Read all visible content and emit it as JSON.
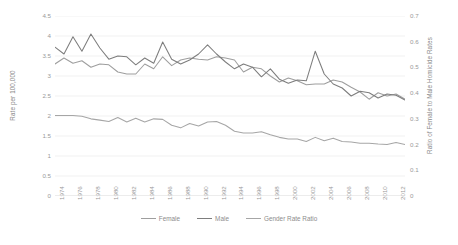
{
  "chart_data": {
    "type": "line",
    "title": "",
    "xlabel": "",
    "ylabel": "Rate per 100,000",
    "y2label": "Ratio of Female to Male Homicide Rates",
    "grid": true,
    "legend_position": "bottom",
    "ylim": [
      0,
      4.5
    ],
    "y2lim": [
      0,
      0.7
    ],
    "yticks": [
      "0",
      "0.5",
      "1",
      "1.5",
      "2",
      "2.5",
      "3",
      "3.5",
      "4",
      "4.5"
    ],
    "y2ticks": [
      "0",
      "0.1",
      "0.2",
      "0.3",
      "0.4",
      "0.5",
      "0.6",
      "0.7"
    ],
    "x": [
      1974,
      1975,
      1976,
      1977,
      1978,
      1979,
      1980,
      1981,
      1982,
      1983,
      1984,
      1985,
      1986,
      1987,
      1988,
      1989,
      1990,
      1991,
      1992,
      1993,
      1994,
      1995,
      1996,
      1997,
      1998,
      1999,
      2000,
      2001,
      2002,
      2003,
      2004,
      2005,
      2006,
      2007,
      2008,
      2009,
      2010,
      2011,
      2012,
      2013
    ],
    "xtick_labels": [
      "1974",
      "1976",
      "1978",
      "1980",
      "1982",
      "1984",
      "1986",
      "1988",
      "1990",
      "1992",
      "1994",
      "1996",
      "1998",
      "2000",
      "2002",
      "2004",
      "2006",
      "2008",
      "2010",
      "2012"
    ],
    "series": [
      {
        "name": "Female",
        "axis": "left",
        "color": "#9e9e9e",
        "values": [
          3.3,
          3.45,
          3.32,
          3.38,
          3.22,
          3.3,
          3.28,
          3.1,
          3.05,
          3.05,
          3.3,
          3.18,
          3.48,
          3.26,
          3.4,
          3.45,
          3.42,
          3.4,
          3.48,
          3.45,
          3.4,
          3.1,
          3.22,
          3.18,
          3.0,
          2.85,
          2.95,
          2.88,
          2.78,
          2.8,
          2.8,
          2.9,
          2.85,
          2.72,
          2.6,
          2.42,
          2.58,
          2.5,
          2.55,
          2.42
        ]
      },
      {
        "name": "Male",
        "axis": "left",
        "color": "#7d7d7d",
        "values": [
          3.72,
          3.55,
          3.98,
          3.62,
          4.05,
          3.7,
          3.42,
          3.5,
          3.48,
          3.28,
          3.45,
          3.32,
          3.85,
          3.42,
          3.3,
          3.4,
          3.55,
          3.78,
          3.55,
          3.35,
          3.18,
          3.3,
          3.22,
          2.98,
          3.18,
          2.92,
          2.82,
          2.9,
          2.88,
          3.62,
          3.05,
          2.8,
          2.7,
          2.5,
          2.62,
          2.58,
          2.45,
          2.55,
          2.52,
          2.4
        ]
      },
      {
        "name": "Gender Rate Ratio",
        "axis": "right",
        "color": "#a6a6a6",
        "values": [
          0.313,
          0.313,
          0.313,
          0.31,
          0.3,
          0.295,
          0.29,
          0.305,
          0.288,
          0.302,
          0.288,
          0.3,
          0.298,
          0.275,
          0.265,
          0.282,
          0.272,
          0.288,
          0.29,
          0.275,
          0.252,
          0.245,
          0.245,
          0.25,
          0.238,
          0.228,
          0.222,
          0.222,
          0.212,
          0.228,
          0.215,
          0.225,
          0.212,
          0.21,
          0.205,
          0.205,
          0.202,
          0.2,
          0.208,
          0.2
        ]
      }
    ]
  },
  "legend": {
    "items": [
      {
        "label": "Female"
      },
      {
        "label": "Male"
      },
      {
        "label": "Gender Rate Ratio"
      }
    ]
  }
}
